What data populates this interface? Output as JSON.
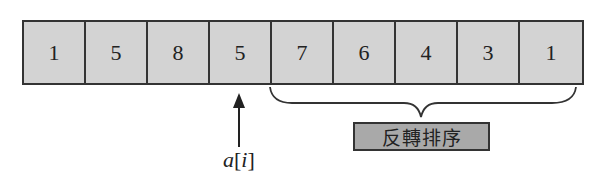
{
  "array": {
    "cells": [
      "1",
      "5",
      "8",
      "5",
      "7",
      "6",
      "4",
      "3",
      "1"
    ],
    "cell_fill": "#d3d3d3",
    "border_color": "#333333"
  },
  "pointer": {
    "target_index": 3,
    "label_var": "a",
    "label_open": "[",
    "label_index": "i",
    "label_close": "]"
  },
  "brace": {
    "from_index": 4,
    "to_index": 8
  },
  "note": {
    "label": "反轉排序",
    "fill": "#a9a9a9"
  }
}
